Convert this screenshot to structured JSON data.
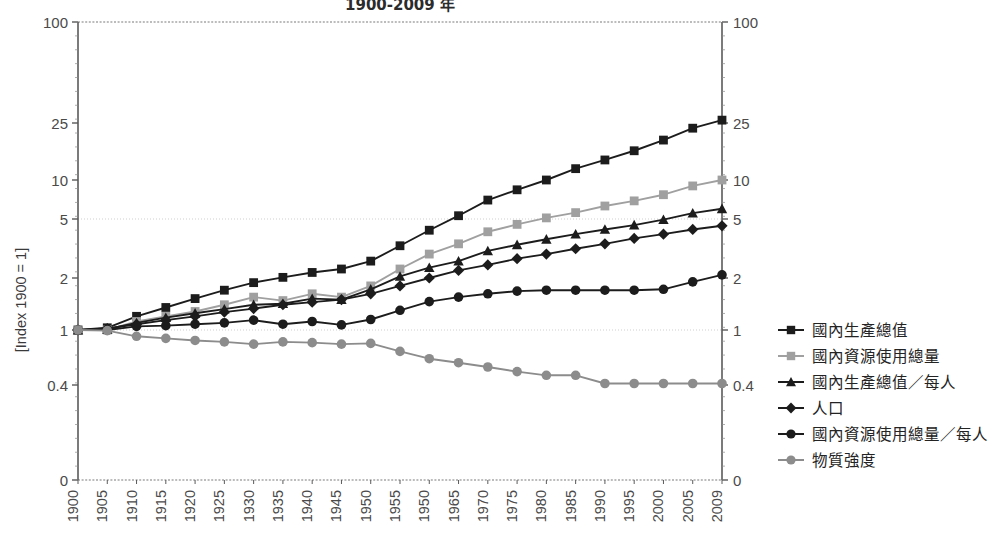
{
  "chart_data": {
    "type": "line",
    "title": "1900-2009 年",
    "xlabel": "",
    "ylabel": "[Index 1900 = 1]",
    "y_scale": "log-like (custom)",
    "ylim": [
      0.4,
      100
    ],
    "y_ticks": [
      "100",
      "25",
      "10",
      "5",
      "2",
      "1",
      "0.4",
      "0"
    ],
    "y_ticks_right": [
      "100",
      "25",
      "10",
      "5",
      "2",
      "1",
      "0.4",
      "0"
    ],
    "gridlines": [
      "5",
      "1"
    ],
    "grid": true,
    "legend_position": "right",
    "x": [
      1900,
      1905,
      1910,
      1915,
      1920,
      1925,
      1930,
      1935,
      1940,
      1945,
      1950,
      1955,
      1950,
      1965,
      1970,
      1975,
      1980,
      1985,
      1990,
      1995,
      2000,
      2005,
      2009
    ],
    "x_tick_labels": [
      "1900",
      "1905",
      "1910",
      "1915",
      "1920",
      "1925",
      "1930",
      "1935",
      "1940",
      "1945",
      "1950",
      "1955",
      "1950",
      "1965",
      "1970",
      "1975",
      "1980",
      "1985",
      "1990",
      "1995",
      "2000",
      "2005",
      "2009"
    ],
    "series": [
      {
        "name": "國內生產總值",
        "marker": "square",
        "color": "#1c1c1c",
        "values": [
          1.0,
          1.03,
          1.2,
          1.35,
          1.52,
          1.7,
          1.88,
          2.02,
          2.18,
          2.3,
          2.6,
          3.3,
          4.2,
          5.3,
          7.0,
          8.4,
          10.0,
          12.0,
          13.8,
          16.0,
          19.0,
          23.0,
          26.0
        ]
      },
      {
        "name": "國內資源使用總量",
        "marker": "square",
        "color": "#a0a0a0",
        "values": [
          1.0,
          1.0,
          1.12,
          1.2,
          1.28,
          1.4,
          1.55,
          1.48,
          1.62,
          1.55,
          1.8,
          2.3,
          2.9,
          3.4,
          4.1,
          4.6,
          5.1,
          5.6,
          6.3,
          6.9,
          7.7,
          9.0,
          10.0
        ]
      },
      {
        "name": "國內生產總值／每人",
        "marker": "triangle",
        "color": "#1c1c1c",
        "values": [
          1.0,
          1.01,
          1.1,
          1.18,
          1.25,
          1.32,
          1.4,
          1.42,
          1.52,
          1.5,
          1.72,
          2.05,
          2.35,
          2.6,
          3.05,
          3.35,
          3.65,
          3.95,
          4.25,
          4.55,
          4.95,
          5.55,
          6.0
        ]
      },
      {
        "name": "人口",
        "marker": "diamond",
        "color": "#1c1c1c",
        "values": [
          1.0,
          1.02,
          1.08,
          1.14,
          1.2,
          1.27,
          1.33,
          1.4,
          1.45,
          1.5,
          1.62,
          1.8,
          2.0,
          2.25,
          2.45,
          2.7,
          2.9,
          3.15,
          3.4,
          3.7,
          3.95,
          4.25,
          4.5
        ]
      },
      {
        "name": "國內資源使用總量／每人",
        "marker": "circle",
        "color": "#1c1c1c",
        "values": [
          1.0,
          1.0,
          1.05,
          1.06,
          1.08,
          1.1,
          1.14,
          1.08,
          1.12,
          1.07,
          1.15,
          1.3,
          1.46,
          1.55,
          1.62,
          1.68,
          1.7,
          1.7,
          1.7,
          1.7,
          1.72,
          1.9,
          2.1
        ]
      },
      {
        "name": "物質強度",
        "marker": "circle",
        "color": "#8c8c8c",
        "values": [
          1.0,
          0.99,
          0.9,
          0.87,
          0.84,
          0.82,
          0.79,
          0.82,
          0.81,
          0.79,
          0.8,
          0.7,
          0.62,
          0.58,
          0.54,
          0.5,
          0.47,
          0.47,
          0.41,
          0.41,
          0.41,
          0.41,
          0.41
        ]
      }
    ]
  },
  "legend": {
    "items": [
      {
        "label": "國內生產總值",
        "marker": "square",
        "color": "#1c1c1c"
      },
      {
        "label": "國內資源使用總量",
        "marker": "square",
        "color": "#a0a0a0"
      },
      {
        "label": "國內生產總值／每人",
        "marker": "triangle",
        "color": "#1c1c1c"
      },
      {
        "label": "人口",
        "marker": "diamond",
        "color": "#1c1c1c"
      },
      {
        "label": "國內資源使用總量／每人",
        "marker": "circle",
        "color": "#1c1c1c"
      },
      {
        "label": "物質強度",
        "marker": "circle",
        "color": "#8c8c8c"
      }
    ]
  },
  "colors": {
    "axis": "#5a5a5a",
    "grid": "#cfcfcf",
    "background": "#ffffff",
    "text": "#3a3a3a"
  }
}
